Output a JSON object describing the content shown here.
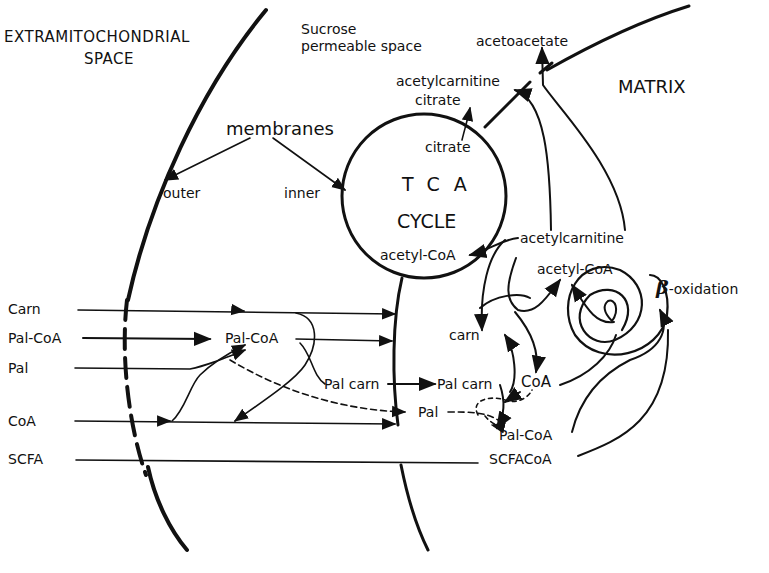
{
  "diagram": {
    "regions": {
      "extramitochondrial": [
        "EXTRAMITOCHONDRIAL",
        "SPACE"
      ],
      "sucrose": [
        "Sucrose",
        "permeable space"
      ],
      "matrix": "MATRIX"
    },
    "membranes": {
      "title": "membranes",
      "outer": "outer",
      "inner": "inner"
    },
    "tca": {
      "line1": "TCA",
      "line2": "CYCLE",
      "citrate_in": "citrate",
      "acetyl_coa": "acetyl-CoA"
    },
    "top_labels": {
      "acetoacetate": "acetoacetate",
      "acetylcarnitine": "acetylcarnitine",
      "citrate": "citrate"
    },
    "matrix_labels": {
      "acetylcarnitine": "acetylcarnitine",
      "acetyl_coa": "acetyl-CoA",
      "beta_oxidation_symbol": "β",
      "beta_oxidation": "-oxidation",
      "carn": "carn",
      "coa": "CoA",
      "palcarn": "Pal carn",
      "pal_coa": "Pal-CoA",
      "scfacoa": "SCFACoA"
    },
    "left_inputs": [
      "Carn",
      "Pal-CoA",
      "Pal",
      "CoA",
      "SCFA"
    ],
    "intermembrane": {
      "pal_coa": "Pal-CoA",
      "palcarn": "Pal carn",
      "pal": "Pal"
    },
    "colors": {
      "ink": "#111111",
      "background": "#ffffff"
    }
  }
}
